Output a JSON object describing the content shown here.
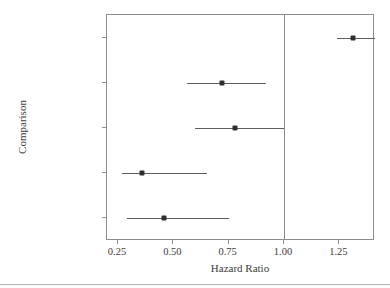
{
  "chart_data": {
    "type": "scatter",
    "subtype": "forest-plot",
    "title": "",
    "xlabel": "Hazard Ratio",
    "ylabel": "Comparison",
    "xlim": [
      0.2,
      1.41
    ],
    "xticks": [
      0.25,
      0.5,
      0.75,
      1.0,
      1.25
    ],
    "xticklabels": [
      "0.25",
      "0.50",
      "0.75",
      "1.00",
      "1.25"
    ],
    "grid": false,
    "legend": null,
    "reference_line": {
      "value": 1.0,
      "orientation": "vertical",
      "color": "#8d8d8d"
    },
    "categories": [
      "pnodes Unit = 5",
      "horm Unit = 1",
      "tgrade II vs III",
      "tgrade I vs III",
      "tgrade I vs II"
    ],
    "point_color": "#2f2f2f",
    "line_color": "#5e5e5e",
    "rows": [
      {
        "label": "pnodes Unit = 5",
        "estimate": 1.31,
        "ci_low": 1.24,
        "ci_high": 1.41
      },
      {
        "label": "horm Unit = 1",
        "estimate": 0.72,
        "ci_low": 0.56,
        "ci_high": 0.92
      },
      {
        "label": "tgrade II vs III",
        "estimate": 0.78,
        "ci_low": 0.6,
        "ci_high": 1.0
      },
      {
        "label": "tgrade I vs III",
        "estimate": 0.36,
        "ci_low": 0.27,
        "ci_high": 0.65
      },
      {
        "label": "tgrade I vs II",
        "estimate": 0.46,
        "ci_low": 0.29,
        "ci_high": 0.75
      }
    ]
  }
}
